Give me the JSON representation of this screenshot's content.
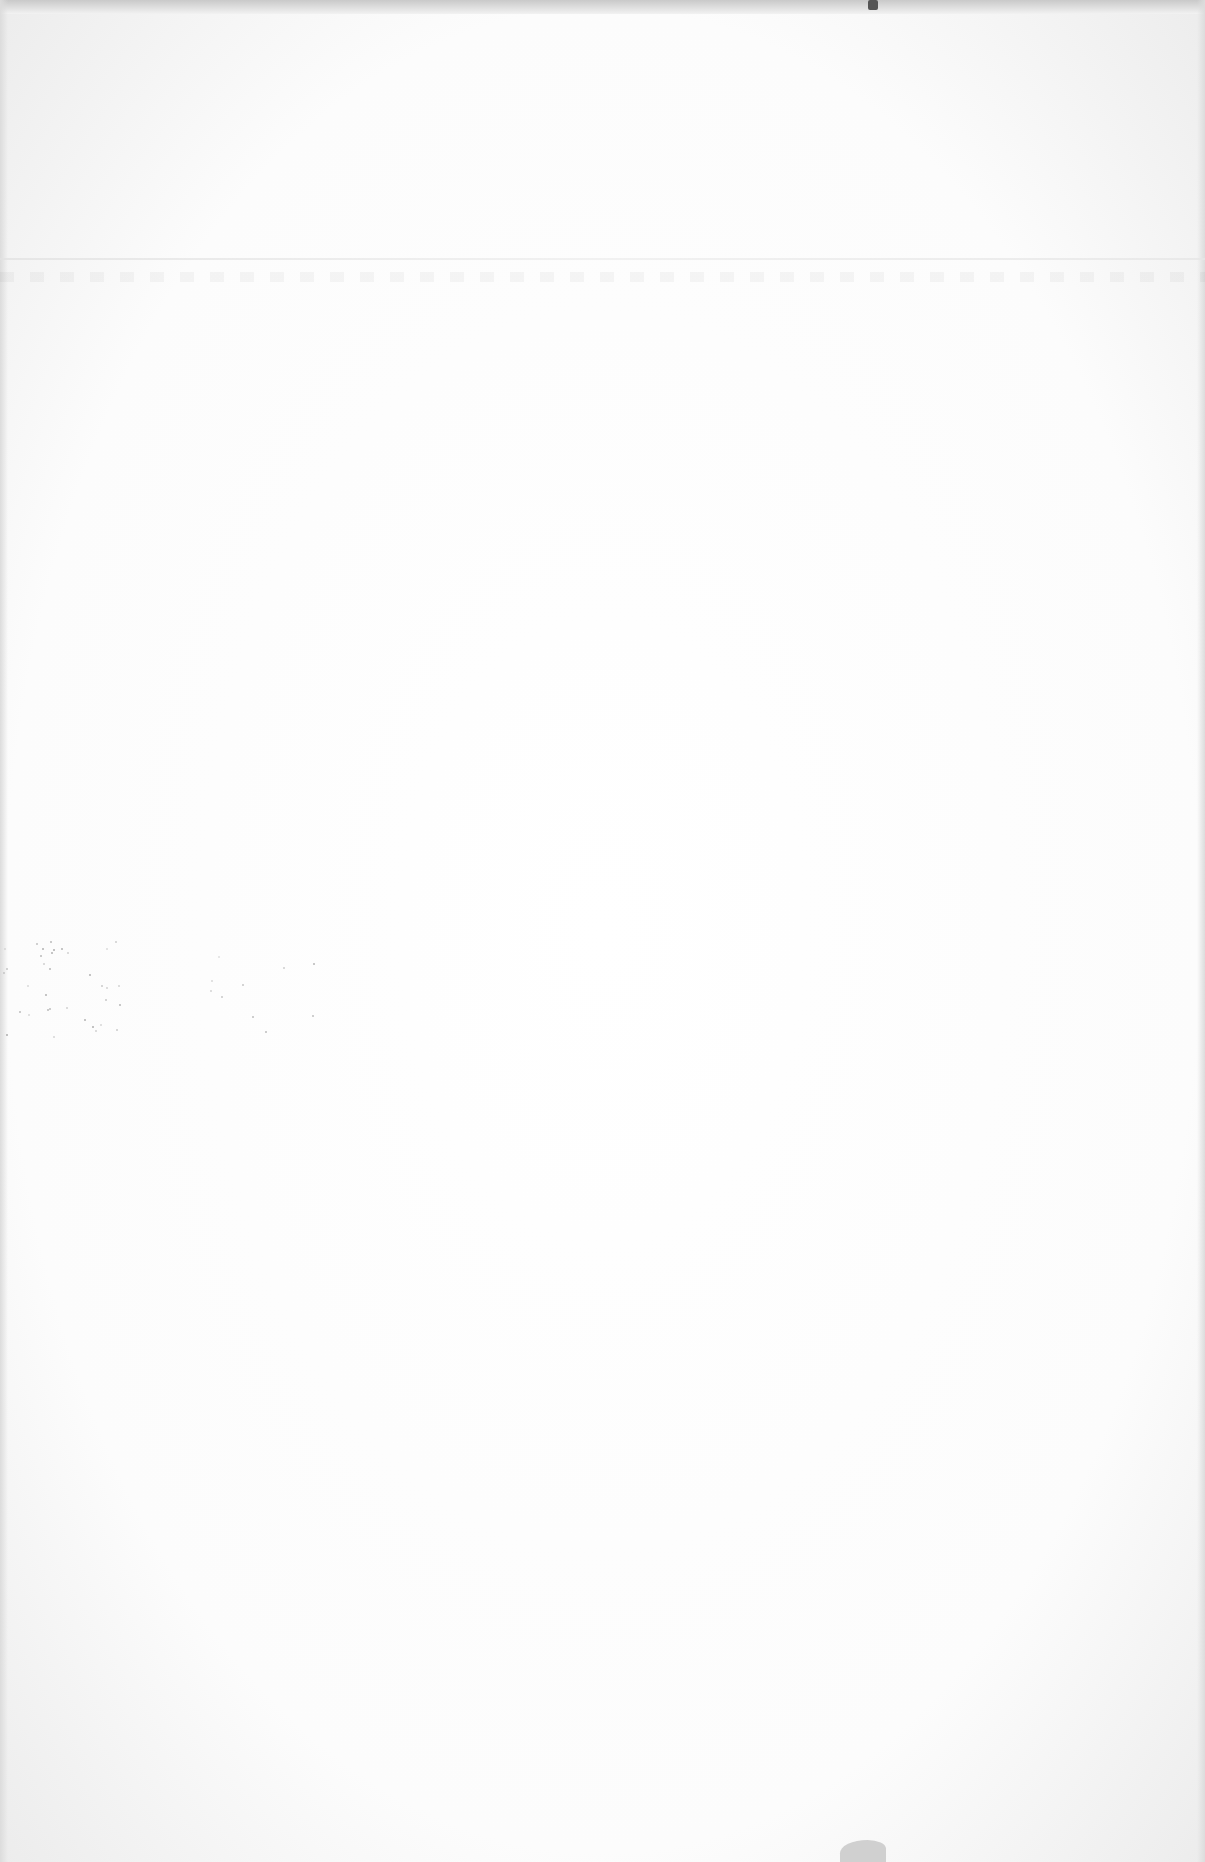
{
  "document": {
    "type": "scanned-page",
    "content": "",
    "colors": {
      "paper": "#ffffff",
      "edge_shadow": "#dcdcdc",
      "speckle": "#9a9a9a"
    }
  }
}
